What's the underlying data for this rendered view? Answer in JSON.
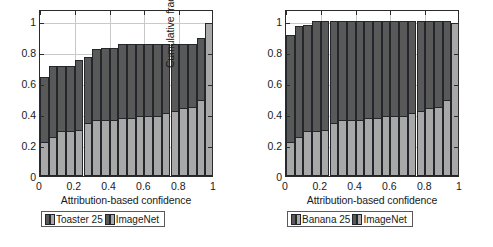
{
  "figure": {
    "panels": [
      "left",
      "right"
    ]
  },
  "chart_data": [
    {
      "type": "bar",
      "panel": "left",
      "title": "",
      "xlabel": "Attribution-based confidence",
      "ylabel": "Cumulative fraction of data",
      "xlim": [
        0,
        1
      ],
      "ylim": [
        0,
        1.08
      ],
      "xticks": [
        "0",
        "0.2",
        "0.4",
        "0.6",
        "0.8",
        "1"
      ],
      "xtick_values": [
        0,
        0.2,
        0.4,
        0.6,
        0.8,
        1
      ],
      "yticks": [
        "0",
        "0.2",
        "0.4",
        "0.6",
        "0.8",
        "1"
      ],
      "ytick_values": [
        0,
        0.2,
        0.4,
        0.6,
        0.8,
        1
      ],
      "grid": true,
      "stacked": true,
      "bar_count": 20,
      "bin_width": 0.05,
      "x": [
        0.025,
        0.075,
        0.125,
        0.175,
        0.225,
        0.275,
        0.325,
        0.375,
        0.425,
        0.475,
        0.525,
        0.575,
        0.625,
        0.675,
        0.725,
        0.775,
        0.825,
        0.875,
        0.925,
        0.975
      ],
      "legend": {
        "position": "below-axes",
        "entries": [
          {
            "label": "Toaster 25",
            "color": "#595959",
            "swatch": "dark"
          },
          {
            "label": "ImageNet",
            "color": "#a8a8a8",
            "swatch": "light"
          }
        ]
      },
      "series": [
        {
          "name": "Toaster 25",
          "note": "total stacked height (outer dark bar)",
          "values": [
            0.64,
            0.71,
            0.71,
            0.71,
            0.75,
            0.77,
            0.82,
            0.83,
            0.83,
            0.855,
            0.855,
            0.855,
            0.855,
            0.855,
            0.855,
            0.855,
            0.855,
            0.855,
            0.89,
            0.99
          ]
        },
        {
          "name": "ImageNet",
          "note": "inner light bar height",
          "values": [
            0.22,
            0.25,
            0.29,
            0.29,
            0.3,
            0.345,
            0.36,
            0.36,
            0.365,
            0.375,
            0.375,
            0.385,
            0.385,
            0.39,
            0.41,
            0.42,
            0.44,
            0.445,
            0.49,
            0.99
          ]
        }
      ]
    },
    {
      "type": "bar",
      "panel": "right",
      "title": "",
      "xlabel": "Attribution-based confidence",
      "ylabel": "Cumulative fraction of data",
      "xlim": [
        0,
        1
      ],
      "ylim": [
        0,
        1.08
      ],
      "xticks": [
        "0",
        "0.2",
        "0.4",
        "0.6",
        "0.8",
        "1"
      ],
      "xtick_values": [
        0,
        0.2,
        0.4,
        0.6,
        0.8,
        1
      ],
      "yticks": [
        "0",
        "0.2",
        "0.4",
        "0.6",
        "0.8",
        "1"
      ],
      "ytick_values": [
        0,
        0.2,
        0.4,
        0.6,
        0.8,
        1
      ],
      "grid": true,
      "stacked": true,
      "bar_count": 20,
      "bin_width": 0.05,
      "x": [
        0.025,
        0.075,
        0.125,
        0.175,
        0.225,
        0.275,
        0.325,
        0.375,
        0.425,
        0.475,
        0.525,
        0.575,
        0.625,
        0.675,
        0.725,
        0.775,
        0.825,
        0.875,
        0.925,
        0.975
      ],
      "legend": {
        "position": "below-axes",
        "entries": [
          {
            "label": "Banana 25",
            "color": "#595959",
            "swatch": "dark"
          },
          {
            "label": "ImageNet",
            "color": "#a8a8a8",
            "swatch": "light"
          }
        ]
      },
      "series": [
        {
          "name": "Banana 25",
          "note": "total stacked height (outer dark bar)",
          "values": [
            0.91,
            0.97,
            0.975,
            1.0,
            1.0,
            1.0,
            1.0,
            1.0,
            1.0,
            1.0,
            1.0,
            1.0,
            1.0,
            1.0,
            1.0,
            1.0,
            1.0,
            1.0,
            1.0,
            0.99
          ]
        },
        {
          "name": "ImageNet",
          "note": "inner light bar height",
          "values": [
            0.22,
            0.25,
            0.29,
            0.29,
            0.3,
            0.345,
            0.36,
            0.36,
            0.365,
            0.375,
            0.375,
            0.385,
            0.385,
            0.39,
            0.41,
            0.42,
            0.44,
            0.445,
            0.49,
            0.99
          ]
        }
      ]
    }
  ]
}
